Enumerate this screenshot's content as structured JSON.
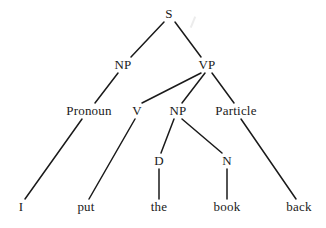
{
  "diagram": {
    "type": "syntax-tree",
    "ink_color": "#1a1a1a",
    "background_color": "#ffffff",
    "sentence": "I put the book back",
    "nodes": [
      {
        "id": "S",
        "label": "S",
        "kind": "category",
        "x": 169,
        "y": 14,
        "level": 0
      },
      {
        "id": "NP1",
        "label": "NP",
        "kind": "category",
        "x": 123,
        "y": 65,
        "level": 1
      },
      {
        "id": "VP",
        "label": "VP",
        "kind": "category",
        "x": 207,
        "y": 65,
        "level": 1
      },
      {
        "id": "Pronoun",
        "label": "Pronoun",
        "kind": "category",
        "x": 89,
        "y": 111,
        "level": 2
      },
      {
        "id": "V",
        "label": "V",
        "kind": "category",
        "x": 137,
        "y": 111,
        "level": 2
      },
      {
        "id": "NP2",
        "label": "NP",
        "kind": "category",
        "x": 178,
        "y": 111,
        "level": 2
      },
      {
        "id": "Particle",
        "label": "Particle",
        "kind": "category",
        "x": 236,
        "y": 111,
        "level": 2
      },
      {
        "id": "D",
        "label": "D",
        "kind": "category",
        "x": 159,
        "y": 161,
        "level": 3
      },
      {
        "id": "N",
        "label": "N",
        "kind": "category",
        "x": 227,
        "y": 161,
        "level": 3
      },
      {
        "id": "I",
        "label": "I",
        "kind": "leaf",
        "x": 21,
        "y": 207,
        "level": 4
      },
      {
        "id": "put",
        "label": "put",
        "kind": "leaf",
        "x": 86,
        "y": 207,
        "level": 4
      },
      {
        "id": "the",
        "label": "the",
        "kind": "leaf",
        "x": 159,
        "y": 207,
        "level": 4
      },
      {
        "id": "book",
        "label": "book",
        "kind": "leaf",
        "x": 227,
        "y": 207,
        "level": 4
      },
      {
        "id": "back",
        "label": "back",
        "kind": "leaf",
        "x": 299,
        "y": 207,
        "level": 4
      }
    ],
    "edges": [
      {
        "from": "S",
        "to": "NP1",
        "x1": 164,
        "y1": 22,
        "x2": 131,
        "y2": 57
      },
      {
        "from": "S",
        "to": "VP",
        "x1": 175,
        "y1": 22,
        "x2": 201,
        "y2": 57
      },
      {
        "from": "NP1",
        "to": "Pronoun",
        "x1": 118,
        "y1": 73,
        "x2": 95,
        "y2": 103
      },
      {
        "from": "VP",
        "to": "V",
        "x1": 201,
        "y1": 73,
        "x2": 142,
        "y2": 103
      },
      {
        "from": "VP",
        "to": "NP2",
        "x1": 205,
        "y1": 73,
        "x2": 182,
        "y2": 103
      },
      {
        "from": "VP",
        "to": "Particle",
        "x1": 212,
        "y1": 73,
        "x2": 234,
        "y2": 103
      },
      {
        "from": "Pronoun",
        "to": "I",
        "x1": 82,
        "y1": 119,
        "x2": 25,
        "y2": 199
      },
      {
        "from": "V",
        "to": "put",
        "x1": 135,
        "y1": 119,
        "x2": 89,
        "y2": 199
      },
      {
        "from": "NP2",
        "to": "D",
        "x1": 174,
        "y1": 119,
        "x2": 161,
        "y2": 153
      },
      {
        "from": "NP2",
        "to": "N",
        "x1": 182,
        "y1": 119,
        "x2": 222,
        "y2": 153
      },
      {
        "from": "D",
        "to": "the",
        "x1": 159,
        "y1": 169,
        "x2": 159,
        "y2": 199
      },
      {
        "from": "N",
        "to": "book",
        "x1": 227,
        "y1": 169,
        "x2": 227,
        "y2": 199
      },
      {
        "from": "Particle",
        "to": "back",
        "x1": 241,
        "y1": 119,
        "x2": 296,
        "y2": 199
      }
    ]
  }
}
